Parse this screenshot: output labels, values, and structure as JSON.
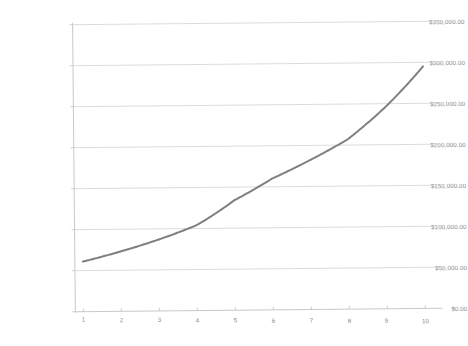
{
  "chart_data": {
    "type": "line",
    "title": "",
    "subtitle": "",
    "xlabel": "",
    "ylabel": "",
    "x": [
      1,
      2,
      3,
      4,
      5,
      6,
      7,
      8,
      9,
      10
    ],
    "categories": [
      "1",
      "2",
      "3",
      "4",
      "5",
      "6",
      "7",
      "8",
      "9",
      "10"
    ],
    "series": [
      {
        "name": "",
        "color": "#808080",
        "line_width": 2,
        "values": [
          61000,
          73000,
          87000,
          104000,
          134000,
          160000,
          182000,
          207000,
          246000,
          295000
        ]
      }
    ],
    "values": [
      61000,
      73000,
      87000,
      104000,
      134000,
      160000,
      182000,
      207000,
      246000,
      295000
    ],
    "ylim": [
      0,
      350000
    ],
    "xlim": [
      1,
      10
    ],
    "ytick_values": [
      0,
      50000,
      100000,
      150000,
      200000,
      250000,
      300000,
      350000
    ],
    "ytick_labels": [
      "$0.00",
      "$50,000.00",
      "$100,000.00",
      "$150,000.00",
      "$200,000.00",
      "$250,000.00",
      "$300,000.00",
      "$350,000.00"
    ],
    "xtick_labels": [
      "1",
      "2",
      "3",
      "4",
      "5",
      "6",
      "7",
      "8",
      "9",
      "10"
    ],
    "grid": {
      "horizontal": true,
      "vertical": false,
      "color": "#d8d8d8"
    },
    "legend": {
      "visible": false,
      "position": "none",
      "entries": []
    },
    "axis_color": "#c9c9c9",
    "background_color": "#ffffff",
    "label_color": "#8a8a8a",
    "annotations": []
  }
}
